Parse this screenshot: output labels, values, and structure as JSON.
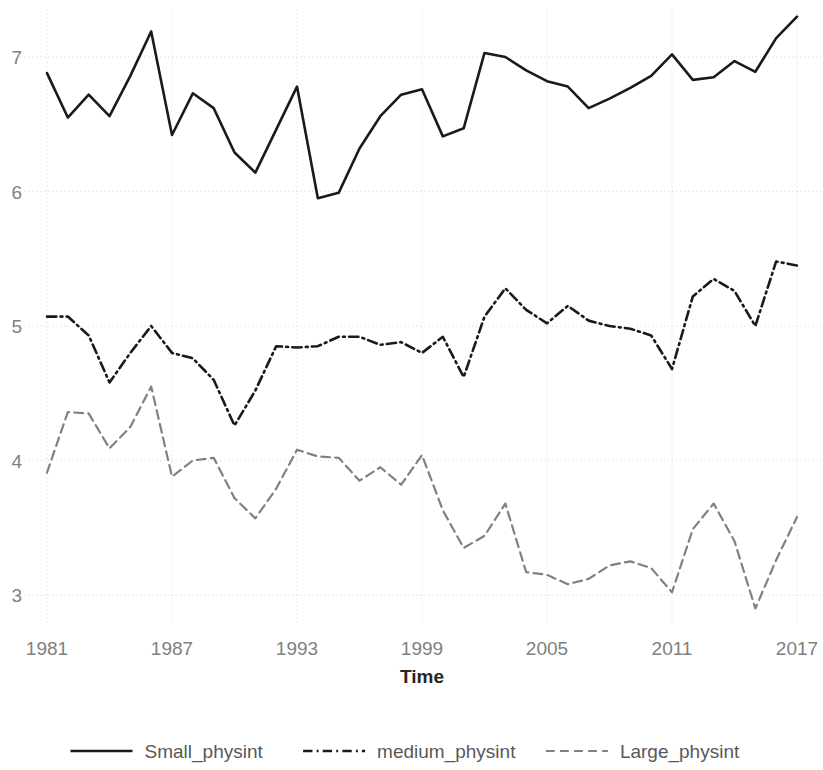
{
  "chart_data": {
    "type": "line",
    "title": "",
    "subtitle": "",
    "xlabel": "Time",
    "ylabel": "",
    "xlim": [
      1981,
      2017
    ],
    "ylim": [
      2.75,
      7.45
    ],
    "grid": true,
    "legend_position": "bottom",
    "x_ticks": [
      "1981",
      "1987",
      "1993",
      "1999",
      "2005",
      "2011",
      "2017"
    ],
    "x_tick_values": [
      1981,
      1987,
      1993,
      1999,
      2005,
      2011,
      2017
    ],
    "y_ticks": [
      "3",
      "4",
      "5",
      "6",
      "7"
    ],
    "y_tick_values": [
      3,
      4,
      5,
      6,
      7
    ],
    "x": [
      1981,
      1982,
      1983,
      1984,
      1985,
      1986,
      1987,
      1988,
      1989,
      1990,
      1991,
      1992,
      1993,
      1994,
      1995,
      1996,
      1997,
      1998,
      1999,
      2000,
      2001,
      2002,
      2003,
      2004,
      2005,
      2006,
      2007,
      2008,
      2009,
      2010,
      2011,
      2012,
      2013,
      2014,
      2015,
      2016,
      2017
    ],
    "series": [
      {
        "name": "Small_physint",
        "style": "solid",
        "color": "#1a1a1a",
        "width": 2.6,
        "values": [
          6.88,
          6.55,
          6.72,
          6.56,
          6.86,
          7.19,
          6.42,
          6.73,
          6.62,
          6.29,
          6.14,
          6.46,
          6.78,
          5.95,
          5.99,
          6.32,
          6.56,
          6.72,
          6.76,
          6.41,
          6.47,
          7.03,
          7.0,
          6.9,
          6.82,
          6.78,
          6.62,
          6.69,
          6.77,
          6.86,
          7.02,
          6.83,
          6.85,
          6.97,
          6.89,
          7.14,
          7.3
        ]
      },
      {
        "name": "medium_physint",
        "style": "dashdot",
        "color": "#1a1a1a",
        "width": 2.6,
        "values": [
          5.07,
          5.07,
          4.93,
          4.58,
          4.8,
          5.0,
          4.8,
          4.76,
          4.6,
          4.26,
          4.52,
          4.85,
          4.84,
          4.85,
          4.92,
          4.92,
          4.86,
          4.88,
          4.8,
          4.92,
          4.62,
          5.07,
          5.28,
          5.12,
          5.02,
          5.15,
          5.04,
          5.0,
          4.98,
          4.93,
          4.68,
          5.22,
          5.35,
          5.26,
          5.0,
          5.48,
          5.45
        ]
      },
      {
        "name": "Large_physint",
        "style": "dashed",
        "color": "#808080",
        "width": 2.2,
        "values": [
          3.91,
          4.36,
          4.35,
          4.09,
          4.25,
          4.55,
          3.88,
          4.0,
          4.02,
          3.72,
          3.57,
          3.79,
          4.08,
          4.03,
          4.02,
          3.85,
          3.95,
          3.82,
          4.04,
          3.63,
          3.35,
          3.44,
          3.68,
          3.17,
          3.15,
          3.08,
          3.12,
          3.22,
          3.25,
          3.2,
          3.02,
          3.49,
          3.68,
          3.4,
          2.9,
          3.26,
          3.58
        ]
      }
    ],
    "legend": [
      {
        "label": "Small_physint",
        "style": "solid",
        "color": "#1a1a1a"
      },
      {
        "label": "medium_physint",
        "style": "dashdot",
        "color": "#1a1a1a"
      },
      {
        "label": "Large_physint",
        "style": "dashed",
        "color": "#808080"
      }
    ]
  }
}
